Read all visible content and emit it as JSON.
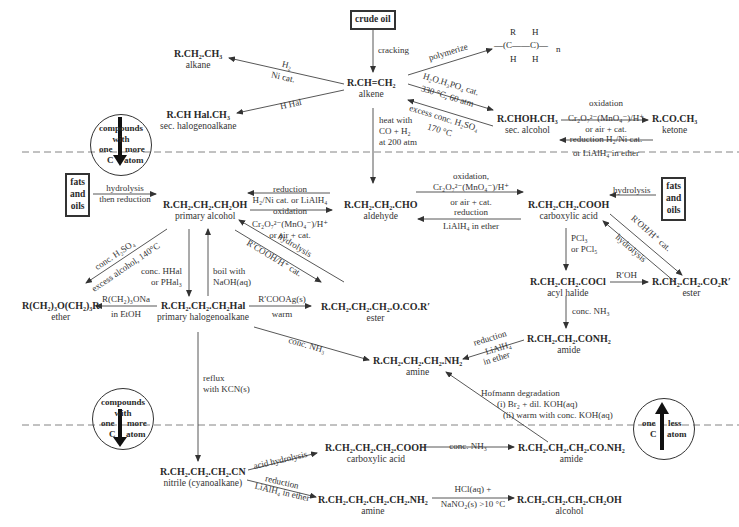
{
  "diagram": {
    "start_box": "crude oil",
    "compounds": {
      "alkene": {
        "formula": "R.CH=CH₂",
        "name": "alkene"
      },
      "alkane": {
        "formula": "R.CH₂.CH₃",
        "name": "alkane"
      },
      "sec_halogenoalkane": {
        "formula": "R.CH Hal.CH₃",
        "name": "sec. halogenoalkane"
      },
      "sec_alcohol": {
        "formula": "R.CHOH.CH₃",
        "name": "sec. alcohol"
      },
      "ketone": {
        "formula": "R.CO.CH₃",
        "name": "ketone"
      },
      "polymer": {
        "top_left": "R",
        "top_right": "H",
        "bottom_left": "H",
        "bottom_right": "H",
        "subscript": "n"
      },
      "primary_alcohol": {
        "formula": "R.CH₂.CH₂.CH₂OH",
        "name": "primary alcohol"
      },
      "aldehyde": {
        "formula": "R.CH₂.CH₂.CHO",
        "name": "aldehyde"
      },
      "carboxylic_acid": {
        "formula": "R.CH₂.CH₂.COOH",
        "name": "carboxylic acid"
      },
      "acyl_halide": {
        "formula": "R.CH₂.CH₂.COCl",
        "name": "acyl halide"
      },
      "ester_right": {
        "formula": "R.CH₂.CH₂.CO₂R′",
        "name": "ester"
      },
      "amide": {
        "formula": "R.CH₂.CH₂.CONH₂",
        "name": "amide"
      },
      "ether": {
        "formula": "R(CH₂)₃O(CH₂)₃R",
        "name": "ether"
      },
      "primary_halogenoalkane": {
        "formula": "R.CH₂.CH₂.CH₂Hal",
        "name": "primary halogenoalkane"
      },
      "ester_mid": {
        "formula": "R.CH₂.CH₂.CH₂.O.CO.R′",
        "name": "ester"
      },
      "amine": {
        "formula": "R.CH₂.CH₂.CH₂.NH₂",
        "name": "amine"
      },
      "nitrile": {
        "formula": "R.CH₂.CH₂.CH₂.CN",
        "name": "nitrile (cyanoalkane)"
      },
      "long_acid": {
        "formula": "R.CH₂.CH₂.CH₂.COOH",
        "name": "carboxylic acid"
      },
      "long_amide": {
        "formula": "R.CH₂.CH₂.CH₂.CO.NH₂",
        "name": "amide"
      },
      "long_amine": {
        "formula": "R.CH₂.CH₂.CH₂.CH₂.NH₂",
        "name": "amine"
      },
      "long_alcohol": {
        "formula": "R.CH₂.CH₂.CH₂.CH₂OH",
        "name": "alcohol"
      }
    },
    "boxes": {
      "fats_left": [
        "fats",
        "and",
        "oils"
      ],
      "fats_right": [
        "fats",
        "and",
        "oils"
      ]
    },
    "circles": {
      "top_left": {
        "line1": "compounds",
        "line2": "with",
        "left": "one",
        "right": "more",
        "left2": "C",
        "right2": "atom"
      },
      "mid_left": {
        "line1": "compounds",
        "line2": "with",
        "left": "one",
        "right": "more",
        "left2": "C",
        "right2": "atom"
      },
      "bottom_right": {
        "left": "one",
        "right": "less",
        "left2": "C",
        "right2": "atom"
      }
    },
    "conditions": {
      "cracking": "cracking",
      "polymerize": "polymerize",
      "h2": "H₂",
      "ni_cat": "Ni cat.",
      "hhal": "H Hal",
      "hydration_1": "H₂O.H₃PO₄ cat.",
      "hydration_2": "330 °C, 60 atm",
      "dehydration_1": "excess conc. H₂SO₄",
      "dehydration_2": "170 °C",
      "ketone_ox_1": "oxidation",
      "ketone_ox_2": "Cr₂O₇²⁻(MnO₄⁻)/H⁺",
      "ketone_ox_3": "or air + cat.",
      "ketone_red_1": "reduction H₂/Ni cat.",
      "ketone_red_2": "or LiAlH₄ in ether",
      "hydroformyl_1": "heat with",
      "hydroformyl_2": "CO + H₂",
      "hydroformyl_3": "at 200 atm",
      "fats_left_1": "hydrolysis",
      "fats_left_2": "then reduction",
      "ald_red_1": "reduction",
      "ald_red_2": "H₂/Ni cat. or LiAlH₄",
      "alc_ox_1": "oxidation",
      "alc_ox_2": "Cr₂O₇²⁻(MnO₄⁻)/H⁺",
      "alc_ox_3": "or air + cat.",
      "acid_ox_1": "oxidation,",
      "acid_ox_2": "Cr₂O₇²⁻(MnO₄⁻)/H⁺",
      "acid_ox_3": "or air + cat.",
      "acid_red_1": "reduction",
      "acid_red_2": "LiAlH₄ in ether",
      "fats_right_1": "hydrolysis",
      "pcl_1": "PCl₃",
      "pcl_2": "or PCl₅",
      "esterify": "R′OH/H⁺ cat.",
      "ester_hydrolysis": "hydrolysis",
      "acyl_ester": "R′OH",
      "acyl_amide": "conc. NH₃",
      "amide_red_1": "reduction",
      "amide_red_2": "LiAlH₄",
      "amide_red_3": "in ether",
      "ether_1": "conc. H₂SO₄",
      "ether_2": "excess alcohol, 140°C",
      "halogenate_1": "conc. HHal",
      "halogenate_2": "or PHal₃",
      "naoh_1": "boil with",
      "naoh_2": "NaOH(aq)",
      "mid_ester_hydrolysis": "hydrolysis",
      "mid_esterify": "R′COOH/H⁺ cat.",
      "williamson_1": "R(CH₂)₃ONa",
      "williamson_2": "in EtOH",
      "silver_1": "R′COOAg(s)",
      "silver_2": "warm",
      "ammonia_hal": "conc. NH₃",
      "kcn_1": "reflux",
      "kcn_2": "with KCN(s)",
      "hofmann_1": "Hofmann degradation",
      "hofmann_2": "(i) Br₂ + dil. KOH(aq)",
      "hofmann_3": "(ii) warm with conc. KOH(aq)",
      "acid_hydrolysis": "acid hydrolysis",
      "nitrile_red_1": "reduction",
      "nitrile_red_2": "LiAlH₄ in ether",
      "long_amide_nh3": "conc. NH₃",
      "diazo_1": "HCl(aq) +",
      "diazo_2": "NaNO₂(s) >10 °C"
    }
  }
}
